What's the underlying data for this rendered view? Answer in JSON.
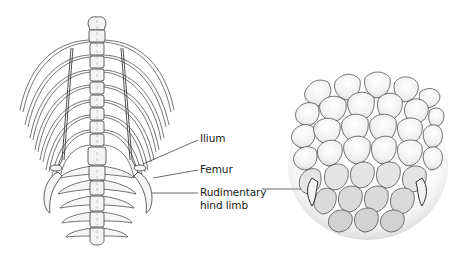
{
  "figure": {
    "panels": [
      {
        "id": "skeleton",
        "description": "Dorsal view of snake vertebral column, ribs and vestigial pelvic girdle"
      },
      {
        "id": "external",
        "description": "External view of scales showing rudimentary hind limb spurs"
      }
    ],
    "labels": {
      "ilium": "Ilium",
      "femur": "Femur",
      "rudimentary_line1": "Rudimentary",
      "rudimentary_line2": "hind limb"
    },
    "colors": {
      "ink": "#2a2a2a",
      "bone_fill": "#f4f4f4",
      "scale_shade": "#bdbdbd",
      "background": "#ffffff"
    }
  }
}
